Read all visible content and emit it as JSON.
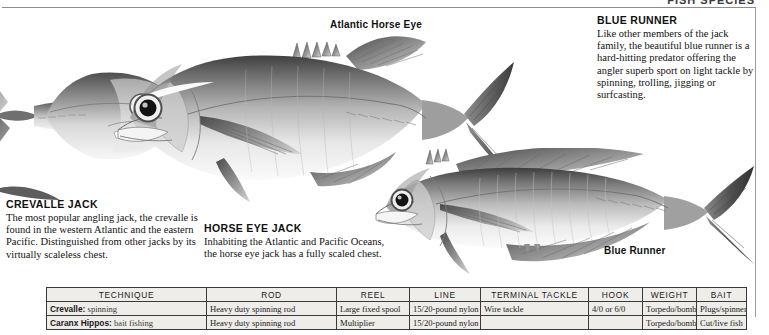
{
  "running_head": "FISH SPECIES",
  "labels": {
    "atlantic_horse_eye": "Atlantic Horse Eye",
    "blue_runner": "Blue Runner"
  },
  "blocks": {
    "crevalle": {
      "heading": "CREVALLE JACK",
      "body": "The most popular angling jack, the crevalle is found in the western Atlantic and the eastern Pacific. Distinguished from other jacks by its virtually scaleless chest."
    },
    "horse_eye": {
      "heading": "HORSE EYE JACK",
      "body": "Inhabiting the Atlantic and Pacific Oceans, the horse eye jack has a fully scaled chest."
    },
    "blue_runner": {
      "heading": "BLUE RUNNER",
      "body": "Like other members of the jack family, the beautiful blue runner is a hard-hitting predator offering the angler superb sport on light tackle by spinning, trolling, jigging or surfcasting."
    }
  },
  "table": {
    "columns": [
      "TECHNIQUE",
      "ROD",
      "REEL",
      "LINE",
      "TERMINAL TACKLE",
      "HOOK",
      "WEIGHT",
      "BAIT"
    ],
    "rows": [
      {
        "species": "Crevalle:",
        "technique": "spinning",
        "rod": "Heavy duty spinning rod",
        "reel": "Large fixed spool",
        "line": "15/20-pound nylon",
        "terminal_tackle": "Wire tackle",
        "hook": "4/0 or 6/0",
        "weight": "Torpedo/bomb",
        "bait": "Plugs/spinners"
      },
      {
        "species": "Caranx Hippos:",
        "technique": "bait fishing",
        "rod": "Heavy duty spinning rod",
        "reel": "Multiplier",
        "line": "15/20-pound nylon",
        "terminal_tackle": "",
        "hook": "",
        "weight": "Torpedo/bomb",
        "bait": "Cut/live fish"
      }
    ]
  },
  "illustrations": [
    {
      "name": "crevalle-jack-illustration",
      "caption": "Crevalle jack, cropped at left edge"
    },
    {
      "name": "atlantic-horse-eye-jack-illustration",
      "caption": "Atlantic horse eye jack, large center fish"
    },
    {
      "name": "blue-runner-illustration",
      "caption": "Blue runner, lower right fish"
    }
  ],
  "colors": {
    "page_background": "#ffffff",
    "table_fill": "#efedea",
    "rule": "#8d8d8d",
    "text": "#111111"
  }
}
